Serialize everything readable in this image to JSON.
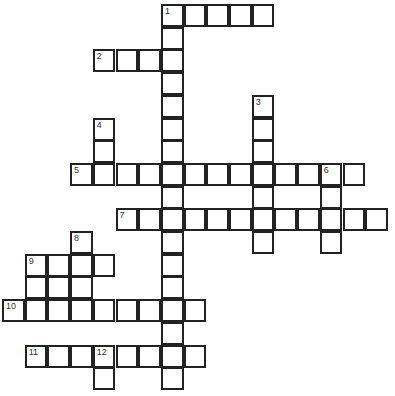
{
  "puzzle": {
    "type": "crossword",
    "origin": {
      "x": 3,
      "y": 5
    },
    "cell_size": 22.7,
    "cells": [
      [
        0,
        7,
        "1"
      ],
      [
        0,
        8,
        ""
      ],
      [
        0,
        9,
        ""
      ],
      [
        0,
        10,
        ""
      ],
      [
        0,
        11,
        ""
      ],
      [
        1,
        7,
        ""
      ],
      [
        2,
        4,
        "2"
      ],
      [
        2,
        5,
        ""
      ],
      [
        2,
        6,
        ""
      ],
      [
        2,
        7,
        ""
      ],
      [
        3,
        7,
        ""
      ],
      [
        4,
        7,
        ""
      ],
      [
        4,
        11,
        "3"
      ],
      [
        5,
        4,
        "4"
      ],
      [
        5,
        7,
        ""
      ],
      [
        5,
        11,
        ""
      ],
      [
        6,
        4,
        ""
      ],
      [
        6,
        7,
        ""
      ],
      [
        6,
        11,
        ""
      ],
      [
        7,
        3,
        "5"
      ],
      [
        7,
        4,
        ""
      ],
      [
        7,
        5,
        ""
      ],
      [
        7,
        6,
        ""
      ],
      [
        7,
        7,
        ""
      ],
      [
        7,
        8,
        ""
      ],
      [
        7,
        9,
        ""
      ],
      [
        7,
        10,
        ""
      ],
      [
        7,
        11,
        ""
      ],
      [
        7,
        12,
        ""
      ],
      [
        7,
        13,
        ""
      ],
      [
        7,
        14,
        "6"
      ],
      [
        7,
        15,
        ""
      ],
      [
        8,
        7,
        ""
      ],
      [
        8,
        11,
        ""
      ],
      [
        8,
        14,
        ""
      ],
      [
        9,
        5,
        "7"
      ],
      [
        9,
        6,
        ""
      ],
      [
        9,
        7,
        ""
      ],
      [
        9,
        8,
        ""
      ],
      [
        9,
        9,
        ""
      ],
      [
        9,
        10,
        ""
      ],
      [
        9,
        11,
        ""
      ],
      [
        9,
        12,
        ""
      ],
      [
        9,
        13,
        ""
      ],
      [
        9,
        14,
        ""
      ],
      [
        9,
        15,
        ""
      ],
      [
        9,
        16,
        ""
      ],
      [
        10,
        3,
        "8"
      ],
      [
        10,
        7,
        ""
      ],
      [
        10,
        11,
        ""
      ],
      [
        10,
        14,
        ""
      ],
      [
        11,
        1,
        "9"
      ],
      [
        11,
        2,
        ""
      ],
      [
        11,
        3,
        ""
      ],
      [
        11,
        4,
        ""
      ],
      [
        11,
        7,
        ""
      ],
      [
        12,
        1,
        ""
      ],
      [
        12,
        2,
        ""
      ],
      [
        12,
        3,
        ""
      ],
      [
        12,
        7,
        ""
      ],
      [
        13,
        0,
        "10"
      ],
      [
        13,
        1,
        ""
      ],
      [
        13,
        2,
        ""
      ],
      [
        13,
        3,
        ""
      ],
      [
        13,
        4,
        ""
      ],
      [
        13,
        5,
        ""
      ],
      [
        13,
        6,
        ""
      ],
      [
        13,
        7,
        ""
      ],
      [
        13,
        8,
        ""
      ],
      [
        14,
        7,
        ""
      ],
      [
        15,
        1,
        "11"
      ],
      [
        15,
        2,
        ""
      ],
      [
        15,
        3,
        ""
      ],
      [
        15,
        4,
        "12"
      ],
      [
        15,
        5,
        ""
      ],
      [
        15,
        6,
        ""
      ],
      [
        15,
        7,
        ""
      ],
      [
        15,
        8,
        ""
      ],
      [
        16,
        4,
        ""
      ],
      [
        16,
        7,
        ""
      ]
    ]
  }
}
